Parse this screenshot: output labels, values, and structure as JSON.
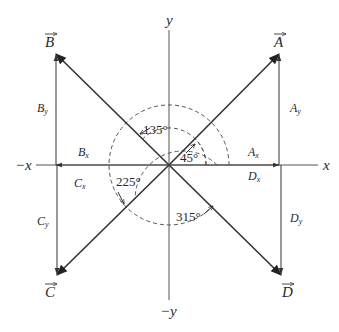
{
  "axes": {
    "x_pos": "x",
    "x_neg": "−x",
    "y_pos": "y",
    "y_neg": "−y"
  },
  "vectors": [
    {
      "name": "A",
      "label": "A",
      "angle_deg": 45,
      "x_comp": "A",
      "x_sub": "x",
      "y_comp": "A",
      "y_sub": "y"
    },
    {
      "name": "B",
      "label": "B",
      "angle_deg": 135,
      "x_comp": "B",
      "x_sub": "x",
      "y_comp": "B",
      "y_sub": "y"
    },
    {
      "name": "C",
      "label": "C",
      "angle_deg": 225,
      "x_comp": "C",
      "x_sub": "x",
      "y_comp": "C",
      "y_sub": "y"
    },
    {
      "name": "D",
      "label": "D",
      "angle_deg": 315,
      "x_comp": "D",
      "x_sub": "x",
      "y_comp": "D",
      "y_sub": "y"
    }
  ],
  "angles": {
    "a45": "45°",
    "a135": "135°",
    "a225": "225°",
    "a315": "315°"
  }
}
